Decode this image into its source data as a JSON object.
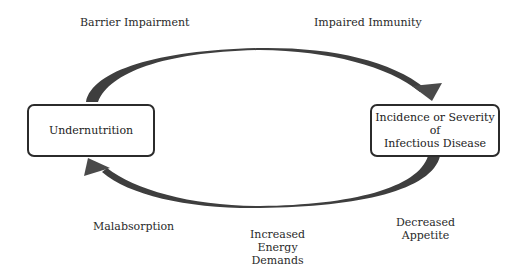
{
  "diagram": {
    "type": "cycle",
    "nodes": [
      {
        "id": "undernutrition",
        "label": "Undernutrition"
      },
      {
        "id": "infectious-disease",
        "label": "Incidence or Severity of\nInfectious Disease"
      }
    ],
    "edges": [
      {
        "from": "undernutrition",
        "to": "infectious-disease",
        "position": "top"
      },
      {
        "from": "infectious-disease",
        "to": "undernutrition",
        "position": "bottom"
      }
    ],
    "top_labels": {
      "left": "Barrier Impairment",
      "right": "Impaired Immunity"
    },
    "bottom_labels": {
      "left": "Malabsorption",
      "center": "Increased\nEnergy\nDemands",
      "right": "Decreased\nAppetite"
    },
    "colors": {
      "arrow": "#4a4a4a",
      "box_border": "#2b2b2b",
      "text": "#222222",
      "background": "#ffffff"
    }
  }
}
